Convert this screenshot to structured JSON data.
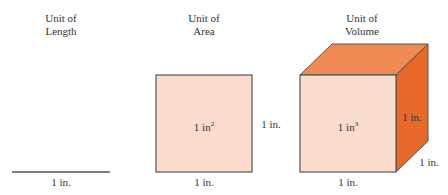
{
  "panels": [
    {
      "title_line1": "Unit of",
      "title_line2": "Length",
      "bottom_label": "1 in."
    },
    {
      "title_line1": "Unit of",
      "title_line2": "Area",
      "center_label": "1 in",
      "center_sup": "2",
      "side_label": "1 in.",
      "bottom_label": "1 in."
    },
    {
      "title_line1": "Unit of",
      "title_line2": "Volume",
      "center_label": "1 in",
      "center_sup": "3",
      "side_label": "1 in.",
      "depth_label": "1 in.",
      "bottom_label": "1 in."
    }
  ],
  "colors": {
    "face_front": "#f9dccb",
    "face_top": "#f08a55",
    "face_side": "#e8682a",
    "stroke": "#555555"
  }
}
